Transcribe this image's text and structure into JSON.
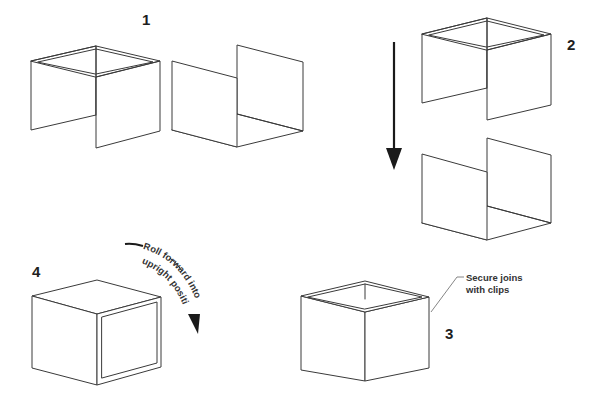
{
  "diagram": {
    "steps": [
      {
        "number": "1",
        "description": "Two U-shaped halves: one with top rim frame, one open"
      },
      {
        "number": "2",
        "description": "Lower one half onto the other"
      },
      {
        "number": "3",
        "description": "Assembled open box",
        "callout": {
          "line1": "Secure joins",
          "line2": "with clips"
        }
      },
      {
        "number": "4",
        "description": "Closed box on its side with framed face",
        "rotation_label": {
          "line1": "Roll forward into",
          "line2": "upright position"
        }
      }
    ],
    "icons": {
      "down_arrow": "arrow-down-icon",
      "curved_arrow": "curved-arrow-icon"
    },
    "colors": {
      "line": "#3a3a3a",
      "arrow": "#1a1a1a",
      "text": "#333333",
      "background": "#ffffff"
    }
  }
}
